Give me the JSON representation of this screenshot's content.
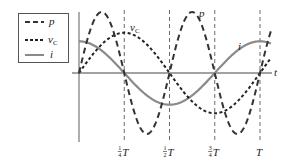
{
  "chart_data": {
    "type": "line",
    "title": "",
    "xlabel": "t",
    "ylabel": "",
    "grid": false,
    "legend_position": "top-left",
    "x_range_periods": [
      0,
      1.0
    ],
    "x_ticks": [
      {
        "value": 0.25,
        "num": "1",
        "den": "4",
        "suffix": "T"
      },
      {
        "value": 0.5,
        "num": "1",
        "den": "2",
        "suffix": "T"
      },
      {
        "value": 0.75,
        "num": "3",
        "den": "4",
        "suffix": "T"
      },
      {
        "value": 1.0,
        "num": "",
        "den": "",
        "suffix": "T"
      }
    ],
    "series": [
      {
        "name": "p",
        "label": "p",
        "sub": "",
        "style": "long-dash",
        "color": "#333333",
        "function": "sin(4πt/T)",
        "amplitude": 1.0
      },
      {
        "name": "vC",
        "label": "v",
        "sub": "C",
        "style": "short-dash",
        "color": "#222222",
        "function": "sin(2πt/T)",
        "amplitude": 0.66
      },
      {
        "name": "i",
        "label": "i",
        "sub": "",
        "style": "solid",
        "color": "#8a8a8a",
        "function": "cos(2πt/T)",
        "amplitude": 0.52
      }
    ],
    "annotations": [
      {
        "text": "p",
        "near": "second positive peak of p"
      },
      {
        "text": "vC",
        "near": "first peak of vC"
      },
      {
        "text": "i",
        "near": "rising i near 3/4 T"
      }
    ]
  }
}
